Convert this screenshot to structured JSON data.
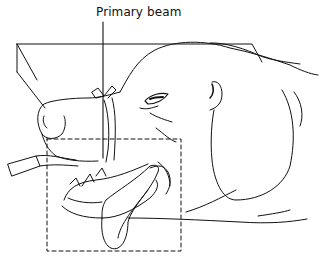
{
  "figure": {
    "annotation": "Primary beam",
    "colors": {
      "line": "#111111",
      "background": "#ffffff"
    }
  }
}
